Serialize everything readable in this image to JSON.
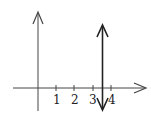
{
  "diagram": {
    "type": "number-line-graph",
    "x_axis": {
      "ticks": [
        {
          "label": "1",
          "value": 1
        },
        {
          "label": "2",
          "value": 2
        },
        {
          "label": "3",
          "value": 3
        },
        {
          "label": "4",
          "value": 4
        }
      ]
    },
    "y_axis": {
      "label": ""
    },
    "vertical_line": {
      "x": 3.5,
      "description": "double-headed vertical arrow at x = 3.5"
    },
    "colors": {
      "axis": "#333333",
      "line": "#222222"
    }
  }
}
